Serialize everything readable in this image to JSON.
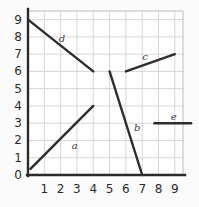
{
  "chart_data": {
    "type": "line",
    "title": "",
    "xlabel": "",
    "ylabel": "",
    "xlim": [
      0,
      9.5
    ],
    "ylim": [
      0,
      9.5
    ],
    "grid": true,
    "legend": "inline-labels",
    "xticks": [
      "1",
      "2",
      "3",
      "4",
      "5",
      "6",
      "7",
      "8",
      "9"
    ],
    "yticks": [
      "0",
      "1",
      "2",
      "3",
      "4",
      "5",
      "6",
      "7",
      "8",
      "9"
    ],
    "xtick_values": [
      1,
      2,
      3,
      4,
      5,
      6,
      7,
      8,
      9
    ],
    "ytick_values": [
      0,
      1,
      2,
      3,
      4,
      5,
      6,
      7,
      8,
      9
    ],
    "series": [
      {
        "name": "a",
        "label": "a",
        "x": [
          0.15,
          4.0
        ],
        "y": [
          0.35,
          4.0
        ],
        "slope": 0.95,
        "color": "#2d2d2d"
      },
      {
        "name": "b",
        "label": "b",
        "x": [
          5.0,
          7.0
        ],
        "y": [
          6.0,
          0.0
        ],
        "slope": -3.0,
        "color": "#2d2d2d"
      },
      {
        "name": "c",
        "label": "c",
        "x": [
          6.0,
          9.0
        ],
        "y": [
          6.0,
          7.0
        ],
        "slope": 0.33,
        "color": "#2d2d2d"
      },
      {
        "name": "d",
        "label": "d",
        "x": [
          0.0,
          4.0
        ],
        "y": [
          9.0,
          6.0
        ],
        "slope": -0.75,
        "color": "#2d2d2d"
      },
      {
        "name": "e",
        "label": "e",
        "x": [
          7.75,
          10.0
        ],
        "y": [
          3.0,
          3.0
        ],
        "slope": 0.0,
        "color": "#2d2d2d"
      }
    ]
  },
  "style": {
    "axis_color": "#2b2b2b",
    "grid_color": "#d8d5dc",
    "line_color": "#2d2d2d",
    "background": "#fbfbfb",
    "plot_background": "#ffffff"
  }
}
